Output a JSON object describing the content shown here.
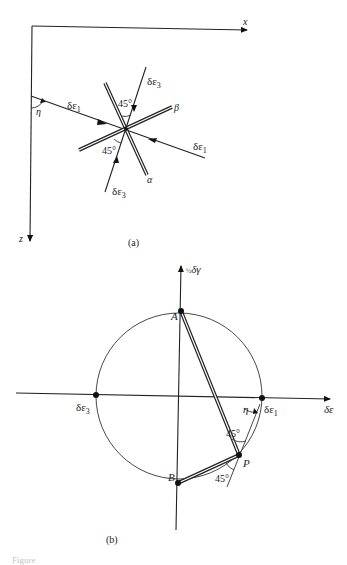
{
  "figure_a": {
    "caption": "(a)",
    "axes": {
      "x_label": "x",
      "z_label": "z"
    },
    "angle_label_eta": "η",
    "strain_labels": {
      "de1_left": "δε",
      "de1_left_sub": "1",
      "de1_right": "δε",
      "de1_right_sub": "1",
      "de3_top": "δε",
      "de3_top_sub": "3",
      "de3_bottom": "δε",
      "de3_bottom_sub": "3"
    },
    "angle_top": "45°",
    "angle_bottom": "45°",
    "line_alpha": "α",
    "line_beta": "β"
  },
  "figure_b": {
    "caption": "(b)",
    "axes": {
      "horizontal_label": "δε",
      "vertical_label_prefix": "½",
      "vertical_label": "δγ"
    },
    "points": {
      "A": "A",
      "B": "B",
      "P": "P",
      "de3": "δε",
      "de3_sub": "3",
      "de1": "δε",
      "de1_sub": "1"
    },
    "angle_eta": "η",
    "angle_upper": "45°",
    "angle_lower": "45°"
  },
  "caption_fragment": "Figure"
}
